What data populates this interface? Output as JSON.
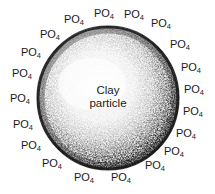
{
  "figure": {
    "background_color": "#ffffff",
    "width": 215,
    "height": 194
  },
  "particle": {
    "label_line1": "Clay",
    "label_line2": "particle",
    "center_x": 108,
    "center_y": 98,
    "radius_x": 71,
    "radius_y": 72,
    "rim_color": "#171717",
    "interior_color": "#f7f7f7",
    "speckle_color": "#222222",
    "name": "clay-particle"
  },
  "labels": {
    "text": "PO",
    "subscript": "4",
    "count": 20,
    "color": "#1a1a1a",
    "positions": [
      {
        "x": 74,
        "y": 19
      },
      {
        "x": 104,
        "y": 13
      },
      {
        "x": 134,
        "y": 14
      },
      {
        "x": 161,
        "y": 23
      },
      {
        "x": 50,
        "y": 34
      },
      {
        "x": 180,
        "y": 44
      },
      {
        "x": 31,
        "y": 52
      },
      {
        "x": 191,
        "y": 67
      },
      {
        "x": 22,
        "y": 73
      },
      {
        "x": 194,
        "y": 89
      },
      {
        "x": 20,
        "y": 98
      },
      {
        "x": 193,
        "y": 111
      },
      {
        "x": 23,
        "y": 124
      },
      {
        "x": 186,
        "y": 133
      },
      {
        "x": 31,
        "y": 145
      },
      {
        "x": 174,
        "y": 151
      },
      {
        "x": 52,
        "y": 163
      },
      {
        "x": 155,
        "y": 165
      },
      {
        "x": 84,
        "y": 177
      },
      {
        "x": 121,
        "y": 177
      }
    ]
  }
}
